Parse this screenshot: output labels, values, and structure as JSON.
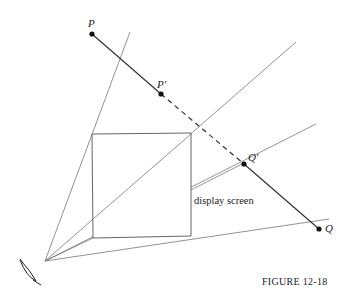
{
  "figure": {
    "caption": "FIGURE 12-18",
    "screen_label": "display screen",
    "points": {
      "P": {
        "label": "P",
        "x": 92,
        "y": 34
      },
      "P_prime": {
        "label": "P′",
        "x": 161,
        "y": 94
      },
      "Q_prime": {
        "label": "Q′",
        "x": 244,
        "y": 164
      },
      "Q": {
        "label": "Q",
        "x": 319,
        "y": 229
      }
    },
    "eye": {
      "x": 45,
      "y": 261,
      "icon": "eye-icon"
    },
    "screen": {
      "tl": [
        92,
        134
      ],
      "tr": [
        191,
        133
      ],
      "br": [
        191,
        236
      ],
      "bl": [
        93,
        238
      ]
    },
    "colors": {
      "line": "#555555",
      "segment": "#333333",
      "text": "#222222"
    }
  }
}
